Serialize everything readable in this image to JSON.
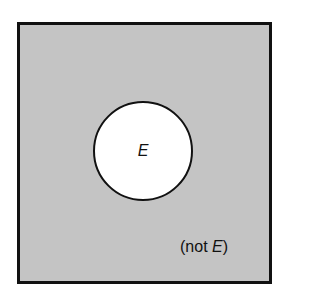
{
  "diagram": {
    "type": "venn",
    "universe": {
      "fill": "#c4c4c4",
      "border": "#111111"
    },
    "event": {
      "label": "E",
      "fill": "#ffffff"
    },
    "complement": {
      "prefix": "(not ",
      "event": "E",
      "suffix": ")"
    }
  }
}
